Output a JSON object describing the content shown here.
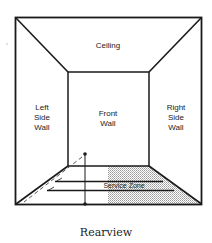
{
  "diagram": {
    "title": "Rearview",
    "labels": {
      "ceiling": "Ceiling",
      "front_wall": [
        "Front",
        "Wall"
      ],
      "left_side_wall": [
        "Left",
        "Side",
        "Wall"
      ],
      "right_side_wall": [
        "Right",
        "Side",
        "Wall"
      ],
      "service_zone": "Service Zone"
    },
    "colors": {
      "line": "#1a1a1a",
      "shading": "#c8c8c8",
      "background": "#ffffff"
    }
  }
}
